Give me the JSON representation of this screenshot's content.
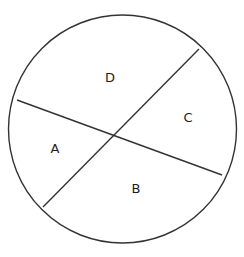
{
  "diagram": {
    "type": "circle-divided-by-two-chords",
    "circle": {
      "cx": 122.5,
      "cy": 129,
      "r": 114,
      "stroke": "#333333",
      "stroke_width": 1.4
    },
    "lines": [
      {
        "name": "chord-left-to-right",
        "x1": 17,
        "y1": 100,
        "x2": 222,
        "y2": 175
      },
      {
        "name": "chord-bottomleft-to-topright",
        "x1": 43,
        "y1": 207,
        "x2": 199,
        "y2": 49
      }
    ],
    "intersection": {
      "x": 120,
      "y": 130
    },
    "regions": [
      {
        "id": "A",
        "label": "A",
        "x": 55,
        "y": 148
      },
      {
        "id": "B",
        "label": "B",
        "x": 136,
        "y": 188
      },
      {
        "id": "C",
        "label": "C",
        "x": 188,
        "y": 117
      },
      {
        "id": "D",
        "label": "D",
        "x": 110,
        "y": 77
      }
    ]
  }
}
